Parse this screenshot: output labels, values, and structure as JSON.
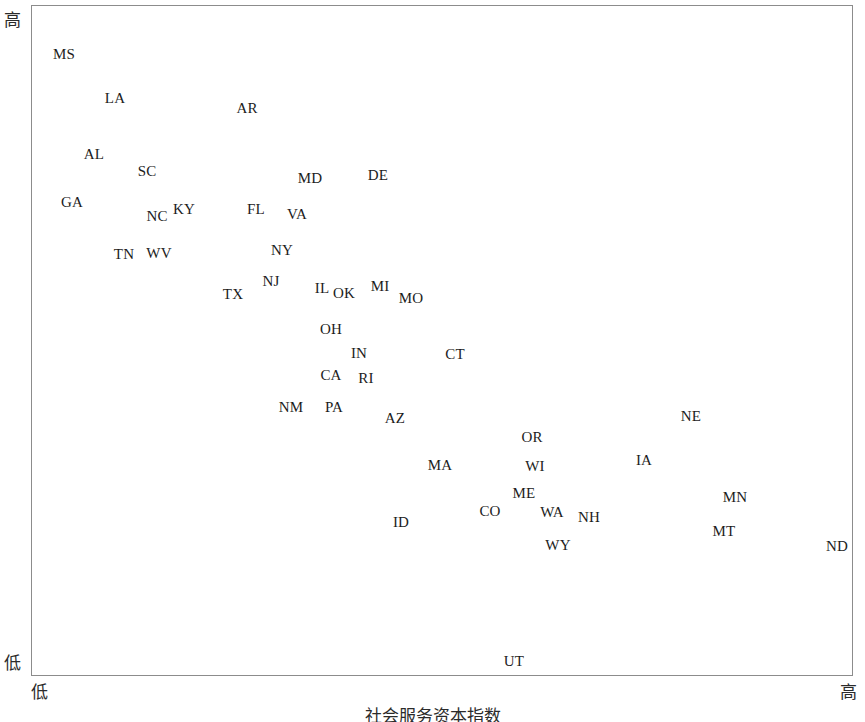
{
  "axes": {
    "y_high_label": "高",
    "y_low_label": "低",
    "x_low_label": "低",
    "x_high_label": "高",
    "x_axis_title": "社会服务资本指数"
  },
  "chart_data": {
    "type": "scatter",
    "title": "",
    "subtitle": "",
    "xlabel": "社会服务资本指数",
    "ylabel": "",
    "xlim": [
      0,
      100
    ],
    "ylim": [
      0,
      100
    ],
    "grid": false,
    "legend": "none",
    "x_tick_labels": [
      "低",
      "高"
    ],
    "y_tick_labels": [
      "低",
      "高"
    ],
    "point_style": "text-label-only",
    "points": [
      {
        "label": "MS",
        "x": 4.1,
        "y": 93.0
      },
      {
        "label": "LA",
        "x": 10.3,
        "y": 85.5
      },
      {
        "label": "AR",
        "x": 26.3,
        "y": 84.7
      },
      {
        "label": "AL",
        "x": 7.6,
        "y": 77.9
      },
      {
        "label": "SC",
        "x": 14.0,
        "y": 75.4
      },
      {
        "label": "MD",
        "x": 33.8,
        "y": 74.4
      },
      {
        "label": "DE",
        "x": 42.1,
        "y": 74.8
      },
      {
        "label": "GA",
        "x": 4.9,
        "y": 70.8
      },
      {
        "label": "NC",
        "x": 15.1,
        "y": 68.7
      },
      {
        "label": "KY",
        "x": 18.4,
        "y": 69.7
      },
      {
        "label": "FL",
        "x": 27.3,
        "y": 69.7
      },
      {
        "label": "VA",
        "x": 32.2,
        "y": 69.0
      },
      {
        "label": "TN",
        "x": 11.2,
        "y": 63.0
      },
      {
        "label": "WV",
        "x": 15.3,
        "y": 63.2
      },
      {
        "label": "NY",
        "x": 30.4,
        "y": 63.6
      },
      {
        "label": "NJ",
        "x": 29.1,
        "y": 59.0
      },
      {
        "label": "TX",
        "x": 24.5,
        "y": 57.1
      },
      {
        "label": "IL",
        "x": 34.3,
        "y": 58.6
      },
      {
        "label": "OK",
        "x": 37.0,
        "y": 57.4
      },
      {
        "label": "MI",
        "x": 42.1,
        "y": 58.3
      },
      {
        "label": "MO",
        "x": 45.9,
        "y": 56.6
      },
      {
        "label": "OH",
        "x": 36.4,
        "y": 51.9
      },
      {
        "label": "IN",
        "x": 39.8,
        "y": 48.3
      },
      {
        "label": "CT",
        "x": 51.5,
        "y": 48.1
      },
      {
        "label": "CA",
        "x": 36.4,
        "y": 45.2
      },
      {
        "label": "RI",
        "x": 40.6,
        "y": 44.6
      },
      {
        "label": "NM",
        "x": 31.5,
        "y": 39.8
      },
      {
        "label": "PA",
        "x": 36.7,
        "y": 39.8
      },
      {
        "label": "AZ",
        "x": 44.0,
        "y": 38.0
      },
      {
        "label": "NE",
        "x": 79.2,
        "y": 38.9
      },
      {
        "label": "OR",
        "x": 60.8,
        "y": 35.8
      },
      {
        "label": "MA",
        "x": 49.4,
        "y": 32.8
      },
      {
        "label": "WI",
        "x": 61.2,
        "y": 32.3
      },
      {
        "label": "IA",
        "x": 74.2,
        "y": 33.1
      },
      {
        "label": "ME",
        "x": 59.9,
        "y": 27.7
      },
      {
        "label": "CO",
        "x": 55.7,
        "y": 25.3
      },
      {
        "label": "WA",
        "x": 62.4,
        "y": 25.0
      },
      {
        "label": "NH",
        "x": 67.2,
        "y": 23.9
      },
      {
        "label": "MN",
        "x": 84.7,
        "y": 27.4
      },
      {
        "label": "ID",
        "x": 44.9,
        "y": 23.2
      },
      {
        "label": "MT",
        "x": 84.0,
        "y": 21.8
      },
      {
        "label": "WY",
        "x": 63.9,
        "y": 20.4
      },
      {
        "label": "ND",
        "x": 97.4,
        "y": 19.7
      },
      {
        "label": "UT",
        "x": 58.6,
        "y": 2.4
      }
    ]
  },
  "labels": {
    "MS": "MS",
    "LA": "LA",
    "AR": "AR",
    "AL": "AL",
    "SC": "SC",
    "MD": "MD",
    "DE": "DE",
    "GA": "GA",
    "NC": "NC",
    "KY": "KY",
    "FL": "FL",
    "VA": "VA",
    "TN": "TN",
    "WV": "WV",
    "NY": "NY",
    "NJ": "NJ",
    "TX": "TX",
    "IL": "IL",
    "OK": "OK",
    "MI": "MI",
    "MO": "MO",
    "OH": "OH",
    "IN": "IN",
    "CT": "CT",
    "CA": "CA",
    "RI": "RI",
    "NM": "NM",
    "PA": "PA",
    "AZ": "AZ",
    "NE": "NE",
    "OR": "OR",
    "MA": "MA",
    "WI": "WI",
    "IA": "IA",
    "ME": "ME",
    "CO": "CO",
    "WA": "WA",
    "NH": "NH",
    "MN": "MN",
    "ID": "ID",
    "MT": "MT",
    "WY": "WY",
    "ND": "ND",
    "UT": "UT"
  },
  "pixel_positions": {
    "MS": [
      63,
      53
    ],
    "LA": [
      114,
      97
    ],
    "AR": [
      246,
      107
    ],
    "AL": [
      93,
      153
    ],
    "SC": [
      146,
      170
    ],
    "MD": [
      309,
      177
    ],
    "DE": [
      377,
      174
    ],
    "GA": [
      71,
      201
    ],
    "NC": [
      156,
      215
    ],
    "KY": [
      183,
      208
    ],
    "FL": [
      255,
      208
    ],
    "VA": [
      296,
      213
    ],
    "TN": [
      123,
      253
    ],
    "WV": [
      158,
      252
    ],
    "NY": [
      281,
      249
    ],
    "NJ": [
      270,
      280
    ],
    "TX": [
      232,
      293
    ],
    "IL": [
      321,
      287
    ],
    "OK": [
      343,
      292
    ],
    "MI": [
      379,
      285
    ],
    "MO": [
      410,
      297
    ],
    "OH": [
      330,
      328
    ],
    "IN": [
      358,
      352
    ],
    "CT": [
      454,
      353
    ],
    "CA": [
      330,
      374
    ],
    "RI": [
      365,
      377
    ],
    "NM": [
      290,
      406
    ],
    "PA": [
      333,
      406
    ],
    "AZ": [
      394,
      417
    ],
    "NE": [
      690,
      415
    ],
    "OR": [
      531,
      436
    ],
    "MA": [
      439,
      464
    ],
    "WI": [
      534,
      465
    ],
    "IA": [
      643,
      459
    ],
    "ME": [
      523,
      492
    ],
    "CO": [
      489,
      510
    ],
    "WA": [
      551,
      511
    ],
    "NH": [
      588,
      516
    ],
    "MN": [
      734,
      496
    ],
    "ID": [
      400,
      521
    ],
    "MT": [
      723,
      530
    ],
    "WY": [
      557,
      544
    ],
    "ND": [
      836,
      545
    ],
    "UT": [
      513,
      660
    ]
  }
}
